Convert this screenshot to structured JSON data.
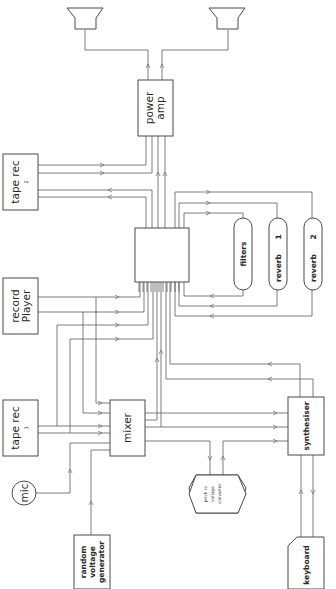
{
  "diagram": {
    "type": "electronic music studio signal-flow block diagram",
    "orientation": "rotated 90 degrees (text reads bottom-to-top)",
    "nodes": {
      "speaker_left": {
        "label": "",
        "icon": "loudspeaker-icon"
      },
      "speaker_right": {
        "label": "",
        "icon": "loudspeaker-icon"
      },
      "power_amp": {
        "label_line1": "power",
        "label_line2": "amp"
      },
      "tape_rec_2": {
        "label_line1": "tape rec",
        "label_line2": "2"
      },
      "record_player": {
        "label_line1": "record",
        "label_line2": "Player"
      },
      "tape_rec_1": {
        "label_line1": "tape rec",
        "label_line2": "1"
      },
      "patch_matrix": {
        "label": ""
      },
      "filters": {
        "label": "filters"
      },
      "reverb_1": {
        "label_line1": "reverb",
        "label_line2": "1"
      },
      "reverb_2": {
        "label_line1": "reverb",
        "label_line2": "2"
      },
      "mixer": {
        "label": "mixer"
      },
      "mic": {
        "label": "mic"
      },
      "random_voltage_generator": {
        "label_line1": "random",
        "label_line2": "voltage",
        "label_line3": "generator"
      },
      "pitch_to_voltage_converter": {
        "label_line1": "pitch to",
        "label_line2": "voltage",
        "label_line3": "converter"
      },
      "synthesiser": {
        "label": "synthesiser"
      },
      "keyboard": {
        "label": "keyboard"
      }
    },
    "connections": [
      {
        "from": "power_amp",
        "to": "speaker_left"
      },
      {
        "from": "power_amp",
        "to": "speaker_right"
      },
      {
        "from": "patch_matrix",
        "to": "power_amp",
        "count": 2
      },
      {
        "from": "tape_rec_2",
        "to": "power_amp",
        "count": 2
      },
      {
        "from": "patch_matrix",
        "to": "tape_rec_2",
        "count": 2
      },
      {
        "from": "patch_matrix",
        "to": "filters"
      },
      {
        "from": "filters",
        "to": "patch_matrix"
      },
      {
        "from": "patch_matrix",
        "to": "reverb_1"
      },
      {
        "from": "reverb_1",
        "to": "patch_matrix"
      },
      {
        "from": "patch_matrix",
        "to": "reverb_2"
      },
      {
        "from": "reverb_2",
        "to": "patch_matrix"
      },
      {
        "from": "record_player",
        "to": "patch_matrix",
        "count": 2
      },
      {
        "from": "record_player",
        "to": "mixer",
        "count": 2
      },
      {
        "from": "tape_rec_1",
        "to": "patch_matrix",
        "count": 2
      },
      {
        "from": "tape_rec_1",
        "to": "mixer",
        "count": 2
      },
      {
        "from": "mic",
        "to": "mixer"
      },
      {
        "from": "random_voltage_generator",
        "to": "mixer"
      },
      {
        "from": "mixer",
        "to": "patch_matrix",
        "count": 2
      },
      {
        "from": "mixer",
        "to": "synthesiser",
        "count": 2
      },
      {
        "from": "mixer",
        "to": "pitch_to_voltage_converter"
      },
      {
        "from": "pitch_to_voltage_converter",
        "to": "synthesiser"
      },
      {
        "from": "synthesiser",
        "to": "patch_matrix",
        "count": 2
      },
      {
        "from": "keyboard",
        "to": "synthesiser"
      },
      {
        "from": "synthesiser",
        "to": "keyboard"
      }
    ]
  }
}
